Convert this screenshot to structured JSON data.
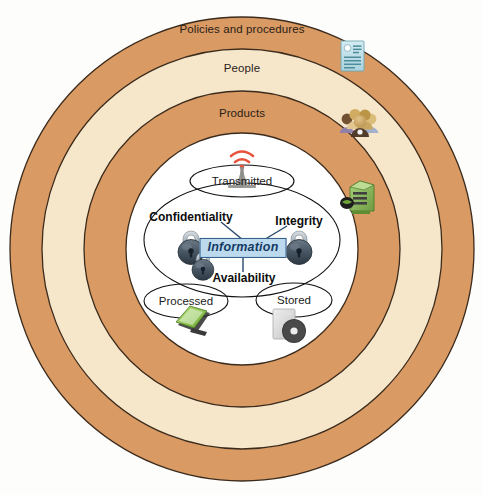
{
  "diagram": {
    "colors": {
      "ring_orange": "#d99a63",
      "ring_cream": "#f6e7cb",
      "ring_stroke": "#3a2a1c",
      "core_white": "#ffffff",
      "info_fill": "#bcd9ee",
      "info_stroke": "#2f5b86",
      "info_text": "#143b63",
      "lock_body": "#4c5a68",
      "lock_shackle": "#b9c2ca",
      "antenna_signal": "#e8513a",
      "antenna_body": "#9a9a96",
      "doc_icon": "#bfdfe6",
      "server_icon": "#8cbf5a",
      "laptop_icon": "#8cc63f",
      "disc_icon": "#dcdcdc",
      "people_icon": "#c9a45c"
    },
    "rings": [
      {
        "id": "policies",
        "label": "Policies and procedures",
        "fill": "#d99a63",
        "label_x": 242,
        "label_y": 30
      },
      {
        "id": "people",
        "label": "People",
        "fill": "#f6e7cb",
        "label_x": 242,
        "label_y": 68
      },
      {
        "id": "products",
        "label": "Products",
        "fill": "#d99a63",
        "label_x": 242,
        "label_y": 113
      }
    ],
    "core": {
      "center_label": "Information",
      "states": [
        {
          "id": "transmitted",
          "label": "Transmitted",
          "x": 242,
          "y": 179,
          "icon": "antenna-icon"
        },
        {
          "id": "processed",
          "label": "Processed",
          "x": 185,
          "y": 300,
          "icon": "laptop-icon"
        },
        {
          "id": "stored",
          "label": "Stored",
          "x": 293,
          "y": 299,
          "icon": "disc-drive-icon"
        }
      ],
      "triad": [
        {
          "id": "confidentiality",
          "label": "Confidentiality",
          "x": 192,
          "y": 215,
          "icon": "lock-icon"
        },
        {
          "id": "integrity",
          "label": "Integrity",
          "x": 298,
          "y": 218,
          "icon": "lock-icon"
        },
        {
          "id": "availability",
          "label": "Availability",
          "x": 243,
          "y": 276,
          "icon": "lock-icon"
        }
      ]
    },
    "side_icons": [
      {
        "id": "document",
        "name": "document-icon",
        "x": 353,
        "y": 48,
        "meaning": "Policies and procedures"
      },
      {
        "id": "people",
        "name": "people-group-icon",
        "x": 356,
        "y": 115,
        "meaning": "People"
      },
      {
        "id": "server",
        "name": "server-icon",
        "x": 355,
        "y": 188,
        "meaning": "Products"
      }
    ]
  }
}
